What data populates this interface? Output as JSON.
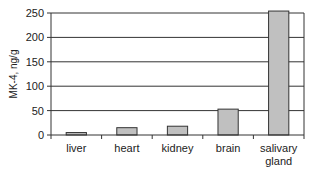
{
  "chart_data": {
    "type": "bar",
    "title": "",
    "xlabel": "",
    "ylabel": "MK-4, ng/g",
    "categories": [
      [
        "liver"
      ],
      [
        "heart"
      ],
      [
        "kidney"
      ],
      [
        "brain"
      ],
      [
        "salivary",
        "gland"
      ]
    ],
    "values": [
      5,
      15,
      18,
      53,
      255
    ],
    "ylim": [
      0,
      250
    ],
    "yticks": [
      0,
      50,
      100,
      150,
      200,
      250
    ],
    "grid": true,
    "legend": "none",
    "colors": {
      "bar_fill": "#c0c0c0",
      "bar_stroke": "#333333",
      "grid": "#333333",
      "axis": "#333333"
    }
  }
}
